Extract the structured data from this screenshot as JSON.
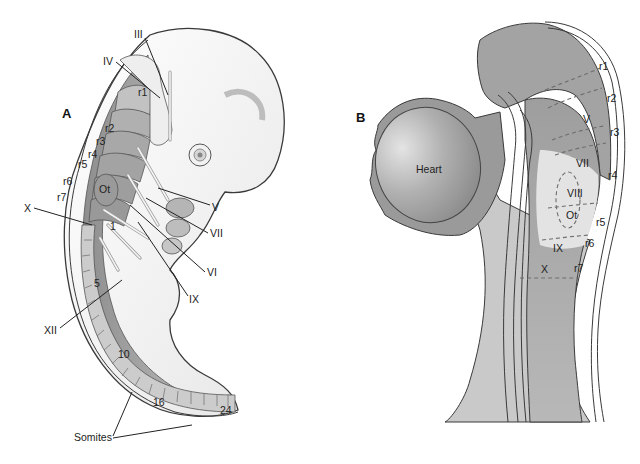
{
  "figure": {
    "panel_a": {
      "label": "A",
      "rhombomeres": [
        "r1",
        "r2",
        "r3",
        "r4",
        "r5",
        "r6",
        "r7"
      ],
      "otic_label": "Ot",
      "nerves": [
        "III",
        "IV",
        "V",
        "VII",
        "VI",
        "IX",
        "X",
        "XII"
      ],
      "somite_numbers": [
        "1",
        "5",
        "10",
        "16",
        "24"
      ],
      "somites_label": "Somites"
    },
    "panel_b": {
      "label": "B",
      "heart_label": "Heart",
      "rhombomeres": [
        "r1",
        "r2",
        "r3",
        "r4",
        "r5",
        "r6",
        "r7"
      ],
      "nerves": [
        "V",
        "VII",
        "VIII",
        "IX",
        "X"
      ],
      "otic_label": "Ot"
    },
    "colors": {
      "neural_tube": "#9c9c9c",
      "light_tissue": "#d9d9d9",
      "outline": "#3a3a3a",
      "background": "#ffffff"
    }
  }
}
